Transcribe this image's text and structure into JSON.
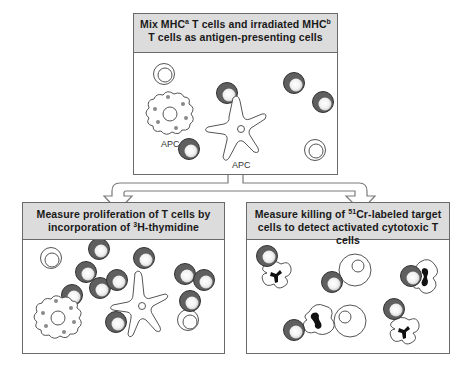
{
  "top_panel": {
    "title_line1_pre": "Mix MHC",
    "title_line1_sup_a": "a",
    "title_line1_mid": " T cells and irradiated MHC",
    "title_line1_sup_b": "b",
    "title_line2": "T cells as antigen-presenting cells",
    "labels": {
      "apc_left": "APC",
      "apc_right": "APC"
    }
  },
  "left_panel": {
    "title_line1": "Measure proliferation of T cells by",
    "title_line2_pre": "incorporation of ",
    "title_line2_sup": "3",
    "title_line2_post": "H-thymidine"
  },
  "right_panel": {
    "title_line1_pre": "Measure killing of ",
    "title_line1_sup": "51",
    "title_line1_post": "Cr-labeled target",
    "title_line2": "cells to detect activated cytotoxic T cells"
  },
  "colors": {
    "header_bg": "#dcdcdc",
    "border": "#6a6a6a",
    "t_cell_dark": "#5f5f5f",
    "granule": "#8a8a8a",
    "nucleus_black": "#111111"
  }
}
